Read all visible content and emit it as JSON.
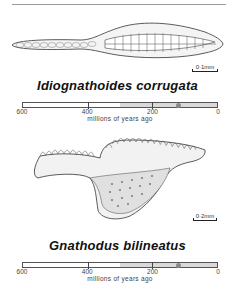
{
  "specimens": [
    {
      "name": "Idiognathoides corrugata",
      "scale_label": "0·1mm",
      "timeline": {
        "tick_labels": [
          "600",
          "400",
          "200",
          "0"
        ],
        "axis_title": "millions of years ago",
        "range_mya": [
          600,
          0
        ],
        "shaded_from_mya": 300,
        "shaded_to_mya": 0,
        "marker_mya": 120
      }
    },
    {
      "name": "Gnathodus bilineatus",
      "scale_label": "0·2mm",
      "timeline": {
        "tick_labels": [
          "600",
          "400",
          "200",
          "0"
        ],
        "axis_title": "millions of years ago",
        "range_mya": [
          600,
          0
        ],
        "shaded_from_mya": 300,
        "shaded_to_mya": 0,
        "marker_mya": 120
      }
    }
  ],
  "colors": {
    "shade": "#d9d9d9",
    "marker": "#8a8a8a",
    "ink": "#111111"
  }
}
